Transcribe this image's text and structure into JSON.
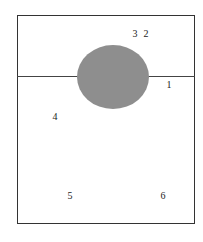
{
  "diagram": {
    "shape": {
      "type": "ellipse",
      "fill": "#8e8e8e"
    },
    "frame_color": "#333333",
    "labels": [
      {
        "id": "1",
        "text": "1",
        "x": 169,
        "y": 85
      },
      {
        "id": "2",
        "text": "2",
        "x": 146,
        "y": 34
      },
      {
        "id": "3",
        "text": "3",
        "x": 135,
        "y": 34
      },
      {
        "id": "4",
        "text": "4",
        "x": 55,
        "y": 117
      },
      {
        "id": "5",
        "text": "5",
        "x": 70,
        "y": 196
      },
      {
        "id": "6",
        "text": "6",
        "x": 163,
        "y": 196
      }
    ]
  }
}
